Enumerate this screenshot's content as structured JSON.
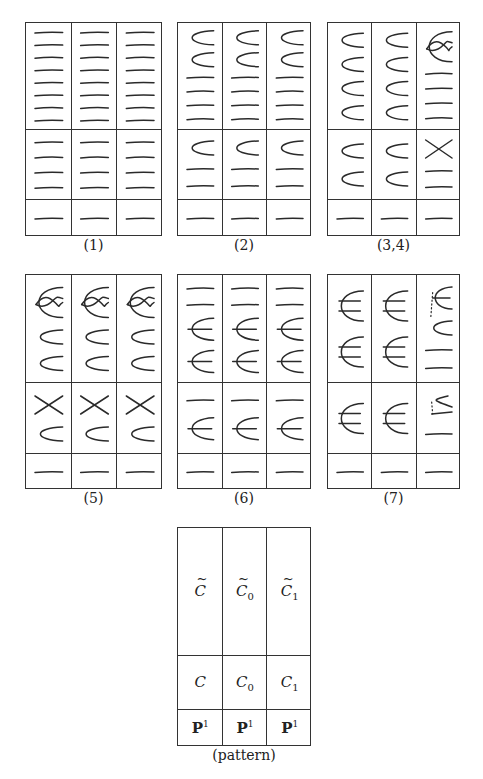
{
  "figure": {
    "panels": [
      {
        "id": "1",
        "caption": "(1)",
        "box": {
          "x": 25,
          "y": 22,
          "w": 137,
          "h": 214
        },
        "rows": [
          107,
          70,
          37
        ],
        "cells": [
          [
            [
              "l",
              "l",
              "l",
              "l",
              "l",
              "l",
              "l",
              "l"
            ],
            [
              "l",
              "l",
              "l",
              "l",
              "l",
              "l",
              "l",
              "l"
            ],
            [
              "l",
              "l",
              "l",
              "l",
              "l",
              "l",
              "l",
              "l"
            ]
          ],
          [
            [
              "l",
              "l",
              "l",
              "l"
            ],
            [
              "l",
              "l",
              "l",
              "l"
            ],
            [
              "l",
              "l",
              "l",
              "l"
            ]
          ],
          [
            [
              "l"
            ],
            [
              "l"
            ],
            [
              "l"
            ]
          ]
        ]
      },
      {
        "id": "2",
        "caption": "(2)",
        "box": {
          "x": 177,
          "y": 22,
          "w": 134,
          "h": 214
        },
        "rows": [
          107,
          70,
          37
        ],
        "cells": [
          [
            [
              "c",
              "c",
              "l",
              "l",
              "l",
              "l"
            ],
            [
              "c",
              "c",
              "l",
              "l",
              "l",
              "l"
            ],
            [
              "c",
              "c",
              "l",
              "l",
              "l",
              "l"
            ]
          ],
          [
            [
              "c",
              "l",
              "l"
            ],
            [
              "c",
              "l",
              "l"
            ],
            [
              "c",
              "l",
              "l"
            ]
          ],
          [
            [
              "l"
            ],
            [
              "l"
            ],
            [
              "l"
            ]
          ]
        ]
      },
      {
        "id": "3,4",
        "caption": "(3,4)",
        "box": {
          "x": 327,
          "y": 22,
          "w": 133,
          "h": 214
        },
        "rows": [
          107,
          70,
          37
        ],
        "cells": [
          [
            [
              "c",
              "c",
              "c",
              "c"
            ],
            [
              "c",
              "c",
              "c",
              "c"
            ],
            [
              "loop",
              "l",
              "l",
              "l",
              "l"
            ]
          ],
          [
            [
              "c",
              "c"
            ],
            [
              "c",
              "c"
            ],
            [
              "x",
              "l",
              "l"
            ]
          ],
          [
            [
              "l"
            ],
            [
              "l"
            ],
            [
              "l"
            ]
          ]
        ]
      },
      {
        "id": "5",
        "caption": "(5)",
        "box": {
          "x": 25,
          "y": 274,
          "w": 137,
          "h": 215
        },
        "rows": [
          108,
          71,
          36
        ],
        "cells": [
          [
            [
              "loop",
              "c",
              "c"
            ],
            [
              "loop",
              "c",
              "c"
            ],
            [
              "loop",
              "c",
              "c"
            ]
          ],
          [
            [
              "x",
              "c"
            ],
            [
              "x",
              "c"
            ],
            [
              "x",
              "c"
            ]
          ],
          [
            [
              "l"
            ],
            [
              "l"
            ],
            [
              "l"
            ]
          ]
        ]
      },
      {
        "id": "6",
        "caption": "(6)",
        "box": {
          "x": 177,
          "y": 274,
          "w": 134,
          "h": 215
        },
        "rows": [
          108,
          71,
          36
        ],
        "cells": [
          [
            [
              "l",
              "l",
              "e",
              "e"
            ],
            [
              "l",
              "l",
              "e",
              "e"
            ],
            [
              "l",
              "l",
              "e",
              "e"
            ]
          ],
          [
            [
              "l",
              "e"
            ],
            [
              "l",
              "e"
            ],
            [
              "l",
              "e"
            ]
          ],
          [
            [
              "l"
            ],
            [
              "l"
            ],
            [
              "l"
            ]
          ]
        ]
      },
      {
        "id": "7",
        "caption": "(7)",
        "box": {
          "x": 327,
          "y": 274,
          "w": 133,
          "h": 215
        },
        "rows": [
          108,
          71,
          36
        ],
        "cells": [
          [
            [
              "E",
              "E"
            ],
            [
              "E",
              "E"
            ],
            [
              "e-dot",
              "c-dot",
              "l",
              "l"
            ]
          ],
          [
            [
              "E"
            ],
            [
              "E"
            ],
            [
              "c-dot-l",
              "l"
            ]
          ],
          [
            [
              "l"
            ],
            [
              "l"
            ],
            [
              "l"
            ]
          ]
        ]
      }
    ],
    "pattern": {
      "caption": "(pattern)",
      "box": {
        "x": 177,
        "y": 527,
        "w": 134,
        "h": 219
      },
      "rows": [
        128,
        54,
        37
      ],
      "cells": [
        [
          {
            "base": "C",
            "tilde": true,
            "sub": ""
          },
          {
            "base": "C",
            "tilde": true,
            "sub": "0"
          },
          {
            "base": "C",
            "tilde": true,
            "sub": "1"
          }
        ],
        [
          {
            "base": "C",
            "tilde": false,
            "sub": ""
          },
          {
            "base": "C",
            "tilde": false,
            "sub": "0"
          },
          {
            "base": "C",
            "tilde": false,
            "sub": "1"
          }
        ],
        [
          {
            "base": "P",
            "sup": "1",
            "bold": true
          },
          {
            "base": "P",
            "sup": "1",
            "bold": true
          },
          {
            "base": "P",
            "sup": "1",
            "bold": true
          }
        ]
      ]
    },
    "legend_of_strokes": {
      "l": "horizontal line (rational curve component)",
      "c": "parabola / cup curve",
      "loop": "nodal curve with loop",
      "x": "crossing lines",
      "e": "cup with middle line (trident)",
      "E": "bracket with two lines (double trident)",
      "e-dot": "trident with dotted connector",
      "c-dot": "cup with dotted connector",
      "c-dot-l": "cup over line with dotted connector"
    },
    "stroke_color": "#2a2a2a"
  }
}
